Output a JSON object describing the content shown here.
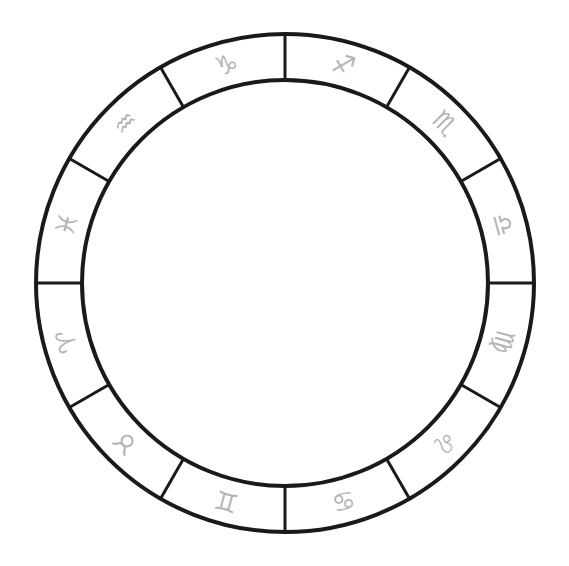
{
  "wheel": {
    "center": [
      285,
      283
    ],
    "outer_radius": 249,
    "inner_radius": 203,
    "ring_color": "#1a1a1a",
    "glyph_color": "#b4b4b4",
    "divisions": 12
  },
  "signs": [
    {
      "name": "Capricorn",
      "glyph": "♑",
      "mid_angle_deg": 105
    },
    {
      "name": "Sagittarius",
      "glyph": "♐",
      "mid_angle_deg": 75
    },
    {
      "name": "Scorpio",
      "glyph": "♏",
      "mid_angle_deg": 45
    },
    {
      "name": "Libra",
      "glyph": "♎",
      "mid_angle_deg": 15
    },
    {
      "name": "Virgo",
      "glyph": "♍",
      "mid_angle_deg": -15
    },
    {
      "name": "Leo",
      "glyph": "♌",
      "mid_angle_deg": -45
    },
    {
      "name": "Cancer",
      "glyph": "♋",
      "mid_angle_deg": -75
    },
    {
      "name": "Gemini",
      "glyph": "♊",
      "mid_angle_deg": -105
    },
    {
      "name": "Taurus",
      "glyph": "♉",
      "mid_angle_deg": -135
    },
    {
      "name": "Aries",
      "glyph": "♈",
      "mid_angle_deg": -165
    },
    {
      "name": "Pisces",
      "glyph": "♓",
      "mid_angle_deg": 165
    },
    {
      "name": "Aquarius",
      "glyph": "♒",
      "mid_angle_deg": 135
    }
  ]
}
